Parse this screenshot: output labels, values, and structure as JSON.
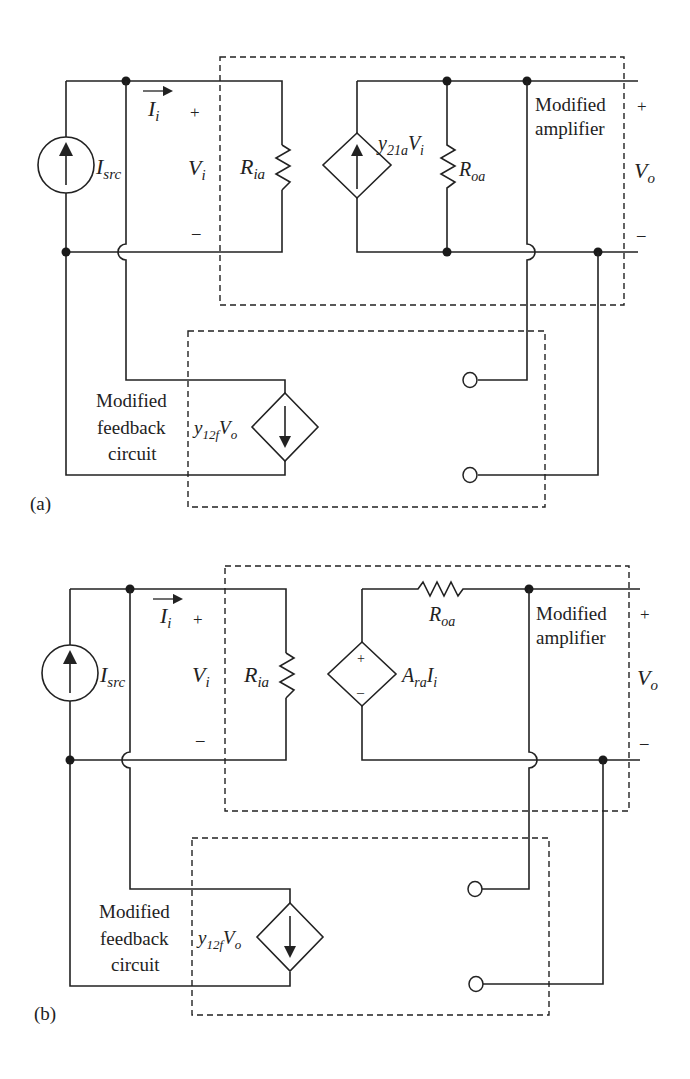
{
  "figure": {
    "panels": [
      {
        "id": "a",
        "panel_label": "(a)",
        "labels": {
          "source": "I",
          "source_sub": "src",
          "input_current": "I",
          "input_current_sub": "i",
          "vi": "V",
          "vi_sub": "i",
          "plus": "+",
          "minus": "–",
          "ria": "R",
          "ria_sub": "ia",
          "dep_source": "y",
          "dep_source_sub": "21a",
          "dep_source_tail": "V",
          "dep_source_tail_sub": "i",
          "roa": "R",
          "roa_sub": "oa",
          "amp_line1": "Modified",
          "amp_line2": "amplifier",
          "vo": "V",
          "vo_sub": "o",
          "fb_line1": "Modified",
          "fb_line2": "feedback",
          "fb_line3": "circuit",
          "fb_source": "y",
          "fb_source_sub": "12f",
          "fb_source_tail": "V",
          "fb_source_tail_sub": "o"
        }
      },
      {
        "id": "b",
        "panel_label": "(b)",
        "labels": {
          "source": "I",
          "source_sub": "src",
          "input_current": "I",
          "input_current_sub": "i",
          "vi": "V",
          "vi_sub": "i",
          "plus": "+",
          "minus": "–",
          "ria": "R",
          "ria_sub": "ia",
          "dep_source": "A",
          "dep_source_sub": "ra",
          "dep_source_tail": "I",
          "dep_source_tail_sub": "i",
          "roa": "R",
          "roa_sub": "oa",
          "amp_line1": "Modified",
          "amp_line2": "amplifier",
          "vo": "V",
          "vo_sub": "o",
          "fb_line1": "Modified",
          "fb_line2": "feedback",
          "fb_line3": "circuit",
          "fb_source": "y",
          "fb_source_sub": "12f",
          "fb_source_tail": "V",
          "fb_source_tail_sub": "o"
        }
      }
    ]
  }
}
